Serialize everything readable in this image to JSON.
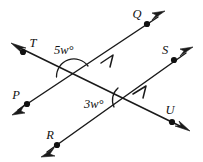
{
  "figure": {
    "type": "geometry-diagram",
    "background_color": "#ffffff",
    "line_color": "#1a1a1a",
    "label_color": "#111111"
  },
  "points": [
    {
      "name": "Q",
      "label": "Q",
      "cx": 147,
      "cy": 24,
      "label_x": 137,
      "label_y": 18
    },
    {
      "name": "T",
      "label": "T",
      "cx": 23,
      "cy": 52,
      "label_x": 30,
      "label_y": 47
    },
    {
      "name": "S",
      "label": "S",
      "cx": 174,
      "cy": 60,
      "label_x": 165,
      "label_y": 54
    },
    {
      "name": "P",
      "label": "P",
      "cx": 27,
      "cy": 104,
      "label_x": 16,
      "label_y": 99
    },
    {
      "name": "U",
      "label": "U",
      "cx": 172,
      "cy": 122,
      "label_x": 166,
      "label_y": 114
    },
    {
      "name": "R",
      "label": "R",
      "cx": 57,
      "cy": 145,
      "label_x": 47,
      "label_y": 139
    }
  ],
  "lines": [
    {
      "name": "line-PQ",
      "from": "P",
      "through": "Q",
      "x1": 14,
      "y1": 113,
      "x2": 162,
      "y2": 14,
      "parallel_marks": 1
    },
    {
      "name": "line-RS",
      "from": "R",
      "through": "S",
      "x1": 43,
      "y1": 155,
      "x2": 190,
      "y2": 50,
      "parallel_marks": 1
    },
    {
      "name": "line-TU",
      "from": "T",
      "through": "U",
      "x1": 14,
      "y1": 45,
      "x2": 187,
      "y2": 130,
      "parallel_marks": 0
    }
  ],
  "intersections": [
    {
      "name": "upper-intersection",
      "x": 72,
      "y": 70,
      "lines": [
        "line-PQ",
        "line-TU"
      ]
    },
    {
      "name": "lower-intersection",
      "x": 128,
      "y": 100,
      "lines": [
        "line-RS",
        "line-TU"
      ]
    }
  ],
  "angles": [
    {
      "name": "angle-5w",
      "label": "5w°",
      "label_x": 54,
      "label_y": 54,
      "vertex_x": 72,
      "vertex_y": 70,
      "arc_radius": 17,
      "position": "above-vertex"
    },
    {
      "name": "angle-3w",
      "label": "3w°",
      "label_x": 84,
      "label_y": 108,
      "vertex_x": 128,
      "vertex_y": 100,
      "arc_radius": 16,
      "position": "left-of-vertex"
    }
  ]
}
